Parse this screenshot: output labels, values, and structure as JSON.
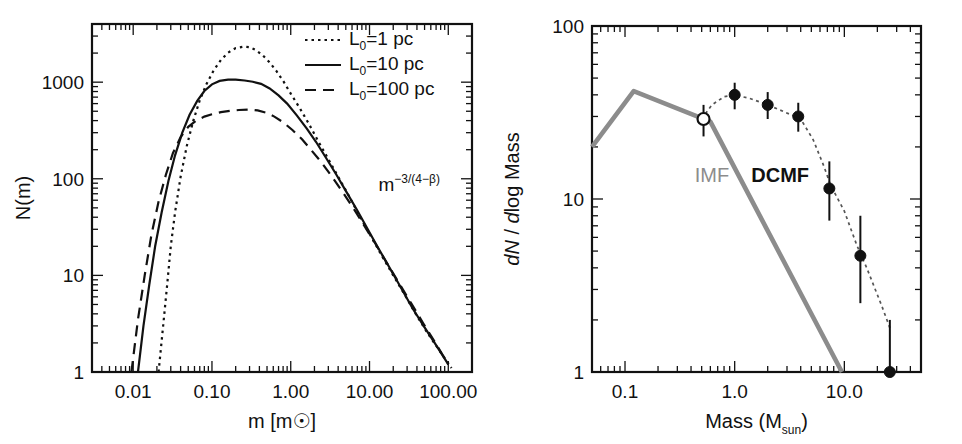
{
  "figure": {
    "title": "",
    "panels": [
      "left",
      "right"
    ]
  },
  "chart_data": [
    {
      "id": "left-panel",
      "type": "line",
      "title": "",
      "xlabel": "m [m☉]",
      "ylabel": "N(m)",
      "xscale": "log",
      "yscale": "log",
      "xlim": [
        0.003,
        200
      ],
      "ylim": [
        1,
        4000
      ],
      "xticks": [
        0.01,
        0.1,
        1,
        10,
        100
      ],
      "xtick_labels": [
        "0.01",
        "0.10",
        "1.00",
        "10.00",
        "100.00"
      ],
      "yticks": [
        1,
        10,
        100,
        1000
      ],
      "ytick_labels": [
        "1",
        "10",
        "100",
        "1000"
      ],
      "grid": false,
      "legend_position": "top-right",
      "annotations": [
        {
          "text": "m",
          "sup": "−3/(4−β)",
          "x": 13.0,
          "y": 75
        }
      ],
      "series": [
        {
          "name": "L_0 = 1 pc",
          "legend_label": "L",
          "legend_sub": "0",
          "legend_rest": "=1 pc",
          "style": "dotted",
          "points": [
            [
              0.021,
              1
            ],
            [
              0.024,
              3
            ],
            [
              0.027,
              8
            ],
            [
              0.03,
              20
            ],
            [
              0.034,
              45
            ],
            [
              0.04,
              105
            ],
            [
              0.048,
              220
            ],
            [
              0.058,
              400
            ],
            [
              0.07,
              650
            ],
            [
              0.085,
              950
            ],
            [
              0.105,
              1320
            ],
            [
              0.13,
              1700
            ],
            [
              0.16,
              2020
            ],
            [
              0.2,
              2250
            ],
            [
              0.25,
              2330
            ],
            [
              0.3,
              2300
            ],
            [
              0.36,
              2150
            ],
            [
              0.44,
              1900
            ],
            [
              0.54,
              1600
            ],
            [
              0.66,
              1300
            ],
            [
              0.82,
              1000
            ],
            [
              1.0,
              760
            ],
            [
              1.3,
              540
            ],
            [
              1.7,
              370
            ],
            [
              2.2,
              250
            ],
            [
              3.0,
              160
            ],
            [
              4.0,
              105
            ],
            [
              5.5,
              66
            ],
            [
              7.5,
              41
            ],
            [
              10.0,
              27
            ],
            [
              14.0,
              16.5
            ],
            [
              20.0,
              10.0
            ],
            [
              28.0,
              6.3
            ],
            [
              40.0,
              3.8
            ],
            [
              55.0,
              2.5
            ],
            [
              80.0,
              1.6
            ],
            [
              110.0,
              1.1
            ],
            [
              150.0,
              0.78
            ],
            [
              200.0,
              0.55
            ]
          ]
        },
        {
          "name": "L_0 = 10 pc",
          "legend_label": "L",
          "legend_sub": "0",
          "legend_rest": "=10 pc",
          "style": "solid",
          "points": [
            [
              0.0115,
              1
            ],
            [
              0.0135,
              3
            ],
            [
              0.016,
              8
            ],
            [
              0.019,
              20
            ],
            [
              0.023,
              45
            ],
            [
              0.028,
              95
            ],
            [
              0.034,
              175
            ],
            [
              0.042,
              300
            ],
            [
              0.052,
              460
            ],
            [
              0.065,
              640
            ],
            [
              0.08,
              810
            ],
            [
              0.1,
              950
            ],
            [
              0.125,
              1030
            ],
            [
              0.16,
              1060
            ],
            [
              0.2,
              1060
            ],
            [
              0.26,
              1040
            ],
            [
              0.33,
              1010
            ],
            [
              0.42,
              960
            ],
            [
              0.54,
              860
            ],
            [
              0.7,
              730
            ],
            [
              0.9,
              600
            ],
            [
              1.2,
              450
            ],
            [
              1.6,
              330
            ],
            [
              2.1,
              240
            ],
            [
              2.8,
              165
            ],
            [
              3.8,
              110
            ],
            [
              5.0,
              75
            ],
            [
              7.0,
              47
            ],
            [
              9.5,
              30
            ],
            [
              13.0,
              19
            ],
            [
              18.0,
              12
            ],
            [
              25.0,
              7.5
            ],
            [
              35.0,
              4.6
            ],
            [
              50.0,
              2.9
            ],
            [
              70.0,
              1.9
            ],
            [
              100.0,
              1.2
            ],
            [
              140.0,
              0.8
            ],
            [
              200.0,
              0.52
            ]
          ]
        },
        {
          "name": "L_0 = 100 pc",
          "legend_label": "L",
          "legend_sub": "0",
          "legend_rest": "=100 pc",
          "style": "dashed",
          "points": [
            [
              0.0095,
              1
            ],
            [
              0.0115,
              3.5
            ],
            [
              0.014,
              10
            ],
            [
              0.017,
              26
            ],
            [
              0.021,
              58
            ],
            [
              0.026,
              110
            ],
            [
              0.032,
              185
            ],
            [
              0.04,
              270
            ],
            [
              0.05,
              345
            ],
            [
              0.063,
              400
            ],
            [
              0.08,
              440
            ],
            [
              0.1,
              465
            ],
            [
              0.13,
              490
            ],
            [
              0.17,
              505
            ],
            [
              0.22,
              515
            ],
            [
              0.29,
              520
            ],
            [
              0.38,
              510
            ],
            [
              0.48,
              485
            ],
            [
              0.62,
              440
            ],
            [
              0.8,
              385
            ],
            [
              1.05,
              320
            ],
            [
              1.4,
              255
            ],
            [
              1.85,
              195
            ],
            [
              2.5,
              145
            ],
            [
              3.4,
              103
            ],
            [
              4.6,
              72
            ],
            [
              6.2,
              50
            ],
            [
              8.5,
              33
            ],
            [
              12.0,
              21
            ],
            [
              17.0,
              13
            ],
            [
              24.0,
              8.2
            ],
            [
              34.0,
              5.1
            ],
            [
              48.0,
              3.2
            ],
            [
              70.0,
              1.95
            ],
            [
              100.0,
              1.2
            ],
            [
              140.0,
              0.8
            ],
            [
              200.0,
              0.52
            ]
          ]
        }
      ]
    },
    {
      "id": "right-panel",
      "type": "scatter",
      "title": "",
      "xlabel": "Mass (M_sun)",
      "xlabel_main": "Mass (M",
      "xlabel_sub": "sun",
      "xlabel_tail": ")",
      "ylabel": "dN / dlog Mass",
      "ylabel_parts": [
        {
          "text": "dN",
          "style": "italic"
        },
        {
          "text": " / ",
          "style": "normal"
        },
        {
          "text": "d",
          "style": "italic"
        },
        {
          "text": "log Mass",
          "style": "normal"
        }
      ],
      "xscale": "log",
      "yscale": "log",
      "xlim": [
        0.05,
        50
      ],
      "ylim": [
        1,
        100
      ],
      "xticks": [
        0.1,
        1.0,
        10.0
      ],
      "xtick_labels": [
        "0.1",
        "1.0",
        "10.0"
      ],
      "yticks": [
        1,
        10,
        100
      ],
      "ytick_labels": [
        "1",
        "10",
        "100"
      ],
      "grid": false,
      "annotations": [
        {
          "text": "IMF",
          "x": 0.62,
          "y": 12.5,
          "color": "#8c8c8c"
        },
        {
          "text": "DCMF",
          "x": 2.6,
          "y": 12.5,
          "color": "#111111"
        }
      ],
      "series": [
        {
          "name": "IMF",
          "style": "solid-thick-gray",
          "color": "#8c8c8c",
          "points": [
            [
              0.05,
              20.0
            ],
            [
              0.12,
              42.0
            ],
            [
              0.6,
              28.0
            ],
            [
              9.5,
              1.0
            ]
          ]
        },
        {
          "name": "DCMF fit",
          "style": "dotted-gray",
          "color": "#555555",
          "points": [
            [
              0.5,
              29.0
            ],
            [
              0.62,
              35.0
            ],
            [
              0.8,
              39.0
            ],
            [
              1.0,
              40.0
            ],
            [
              1.4,
              38.0
            ],
            [
              2.0,
              35.0
            ],
            [
              2.8,
              32.0
            ],
            [
              4.0,
              29.0
            ],
            [
              5.2,
              22.0
            ],
            [
              6.5,
              15.5
            ],
            [
              7.5,
              12.0
            ],
            [
              10.0,
              8.5
            ],
            [
              13.0,
              5.4
            ],
            [
              16.0,
              4.0
            ],
            [
              22.0,
              2.4
            ],
            [
              26.0,
              1.8
            ]
          ]
        },
        {
          "name": "DCMF data",
          "style": "points",
          "points": [
            {
              "x": 0.52,
              "y": 29.0,
              "yerr_up": 6.0,
              "yerr_down": 6.0,
              "marker": "open"
            },
            {
              "x": 1.0,
              "y": 40.0,
              "yerr_up": 7.0,
              "yerr_down": 7.0,
              "marker": "filled"
            },
            {
              "x": 2.0,
              "y": 35.0,
              "yerr_up": 6.5,
              "yerr_down": 6.0,
              "marker": "filled"
            },
            {
              "x": 3.8,
              "y": 30.0,
              "yerr_up": 6.0,
              "yerr_down": 5.5,
              "marker": "filled"
            },
            {
              "x": 7.3,
              "y": 11.5,
              "yerr_up": 5.0,
              "yerr_down": 4.0,
              "marker": "filled"
            },
            {
              "x": 14.0,
              "y": 4.7,
              "yerr_up": 3.3,
              "yerr_down": 2.2,
              "marker": "filled"
            },
            {
              "x": 26.0,
              "y": 1.0,
              "yerr_up": 1.0,
              "yerr_down": 0.0,
              "marker": "filled"
            }
          ]
        }
      ]
    }
  ]
}
